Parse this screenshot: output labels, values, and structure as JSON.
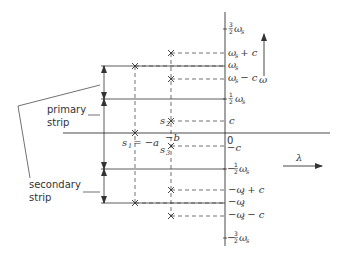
{
  "diagram": {
    "type": "s-plane to z-plane strip mapping (omega-lambda plane)",
    "axes": {
      "horizontal_label": "λ",
      "vertical_label": "ω"
    },
    "tick_labels": {
      "three_halves_ws": {
        "num": "3",
        "den": "2",
        "sym": "ω",
        "sub": "s",
        "sign": ""
      },
      "ws_plus_c": {
        "text": "ω",
        "sub": "s",
        "rest": " + c"
      },
      "ws": {
        "text": "ω",
        "sub": "s"
      },
      "ws_minus_c": {
        "text": "ω",
        "sub": "s",
        "rest": " − c"
      },
      "half_ws": {
        "num": "1",
        "den": "2",
        "sym": "ω",
        "sub": "s",
        "sign": ""
      },
      "c": {
        "text": "c"
      },
      "zero": {
        "text": "0"
      },
      "neg_c": {
        "text": "−c"
      },
      "neg_half_ws": {
        "num": "1",
        "den": "2",
        "sym": "ω",
        "sub": "s",
        "sign": "−"
      },
      "neg_ws_plus_c": {
        "text": "−ω",
        "sub": "s",
        "rest": " + c"
      },
      "neg_ws": {
        "text": "−ω",
        "sub": "s"
      },
      "neg_ws_minus_c": {
        "text": "−ω",
        "sub": "s",
        "rest": " − c"
      },
      "neg_three_halves_ws": {
        "num": "3",
        "den": "2",
        "sym": "ω",
        "sub": "s",
        "sign": "−"
      }
    },
    "poles": {
      "s1": {
        "label": "s",
        "sub": "1",
        "rest": " = −a"
      },
      "s2": {
        "label": "s",
        "sub": "2"
      },
      "s3": {
        "label": "s",
        "sub": "3"
      },
      "neg_b": {
        "text": "−b"
      }
    },
    "strips": {
      "primary": {
        "line1": "primary",
        "line2": "strip"
      },
      "secondary": {
        "line1": "secondary",
        "line2": "strip"
      }
    },
    "colors": {
      "ink": "#333333",
      "background": "#ffffff"
    }
  }
}
